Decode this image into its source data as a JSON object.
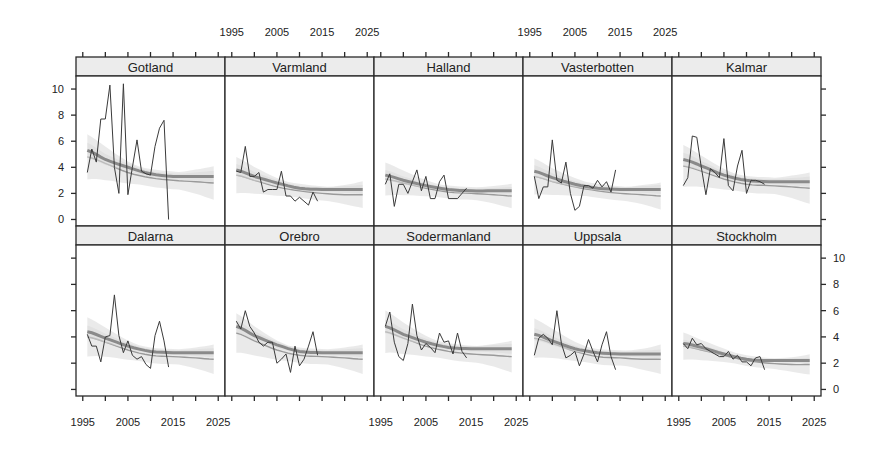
{
  "chart_data": {
    "type": "line",
    "layout": "lattice panels 5 columns x 2 rows",
    "title": "",
    "xlabel": "",
    "ylabel": "",
    "x_ticks": [
      1995,
      2005,
      2015,
      2025
    ],
    "y_ticks": [
      0,
      2,
      4,
      6,
      8,
      10
    ],
    "xlim": [
      1993.5,
      2026.5
    ],
    "ylim": [
      -0.5,
      11.0
    ],
    "grid": false,
    "legend": null,
    "series_description": {
      "observed": "thin dark line (observed annual values)",
      "trend_a": "thick grey smooth line with light grey band (model fit A)",
      "trend_b": "thin grey smooth line with light grey band (model fit B)"
    },
    "panels": [
      {
        "name": "Gotland",
        "row": 0,
        "col": 0,
        "observed_x": [
          1996,
          1997,
          1998,
          1999,
          2000,
          2001,
          2002,
          2003,
          2004,
          2005,
          2006,
          2007,
          2008,
          2009,
          2010,
          2011,
          2012,
          2013,
          2014
        ],
        "observed_y": [
          3.6,
          5.4,
          4.4,
          7.7,
          7.7,
          10.3,
          4.0,
          2.0,
          10.4,
          1.9,
          4.0,
          6.1,
          3.7,
          3.5,
          3.4,
          5.6,
          7.0,
          7.6,
          0.0
        ],
        "trend_a": {
          "x": [
            1996,
            2000,
            2005,
            2010,
            2015,
            2020,
            2024
          ],
          "y": [
            5.3,
            4.6,
            4.0,
            3.5,
            3.3,
            3.3,
            3.3
          ],
          "band": 0.5
        },
        "trend_b": {
          "x": [
            1996,
            2000,
            2005,
            2010,
            2015,
            2020,
            2024
          ],
          "y": [
            4.8,
            4.3,
            3.6,
            3.2,
            3.0,
            2.9,
            2.8
          ],
          "band": 1.5
        }
      },
      {
        "name": "Varmland",
        "row": 0,
        "col": 1,
        "observed_x": [
          1996,
          1997,
          1998,
          1999,
          2000,
          2001,
          2002,
          2003,
          2004,
          2005,
          2006,
          2007,
          2008,
          2009,
          2010,
          2011,
          2012,
          2013,
          2014
        ],
        "observed_y": [
          3.7,
          3.6,
          5.6,
          3.3,
          3.3,
          3.6,
          2.1,
          2.3,
          2.3,
          2.3,
          3.7,
          1.8,
          1.8,
          1.4,
          1.7,
          1.4,
          1.1,
          2.1,
          1.4
        ],
        "trend_a": {
          "x": [
            1996,
            2000,
            2005,
            2010,
            2015,
            2020,
            2024
          ],
          "y": [
            3.8,
            3.3,
            2.8,
            2.4,
            2.3,
            2.3,
            2.3
          ],
          "band": 0.4
        },
        "trend_b": {
          "x": [
            1996,
            2000,
            2005,
            2010,
            2015,
            2020,
            2024
          ],
          "y": [
            3.4,
            3.0,
            2.5,
            2.2,
            2.0,
            1.9,
            1.9
          ],
          "band": 1.2
        }
      },
      {
        "name": "Halland",
        "row": 0,
        "col": 2,
        "observed_x": [
          1996,
          1997,
          1998,
          1999,
          2000,
          2001,
          2002,
          2003,
          2004,
          2005,
          2006,
          2007,
          2008,
          2009,
          2010,
          2011,
          2012,
          2013,
          2014
        ],
        "observed_y": [
          2.7,
          3.5,
          1.0,
          2.7,
          2.7,
          2.0,
          2.9,
          3.8,
          2.2,
          3.3,
          1.6,
          1.6,
          2.9,
          3.4,
          1.6,
          1.6,
          1.6,
          2.0,
          2.4
        ],
        "trend_a": {
          "x": [
            1996,
            2000,
            2005,
            2010,
            2015,
            2020,
            2024
          ],
          "y": [
            3.4,
            3.0,
            2.6,
            2.3,
            2.2,
            2.2,
            2.2
          ],
          "band": 0.35
        },
        "trend_b": {
          "x": [
            1996,
            2000,
            2005,
            2010,
            2015,
            2020,
            2024
          ],
          "y": [
            3.1,
            2.8,
            2.4,
            2.1,
            2.0,
            1.9,
            1.8
          ],
          "band": 1.1
        }
      },
      {
        "name": "Vasterbotten",
        "row": 0,
        "col": 3,
        "observed_x": [
          1996,
          1997,
          1998,
          1999,
          2000,
          2001,
          2002,
          2003,
          2004,
          2005,
          2006,
          2007,
          2008,
          2009,
          2010,
          2011,
          2012,
          2013,
          2014
        ],
        "observed_y": [
          3.3,
          1.6,
          2.5,
          2.5,
          6.1,
          3.0,
          2.8,
          4.4,
          2.0,
          0.7,
          1.0,
          2.6,
          2.6,
          2.4,
          3.0,
          2.5,
          2.9,
          2.1,
          3.8
        ],
        "trend_a": {
          "x": [
            1996,
            2000,
            2005,
            2010,
            2015,
            2020,
            2024
          ],
          "y": [
            3.7,
            3.2,
            2.7,
            2.4,
            2.3,
            2.3,
            2.3
          ],
          "band": 0.4
        },
        "trend_b": {
          "x": [
            1996,
            2000,
            2005,
            2010,
            2015,
            2020,
            2024
          ],
          "y": [
            3.3,
            2.9,
            2.5,
            2.2,
            2.0,
            1.9,
            1.8
          ],
          "band": 1.2
        }
      },
      {
        "name": "Kalmar",
        "row": 0,
        "col": 4,
        "observed_x": [
          1996,
          1997,
          1998,
          1999,
          2000,
          2001,
          2002,
          2003,
          2004,
          2005,
          2006,
          2007,
          2008,
          2009,
          2010,
          2011,
          2012,
          2013,
          2014
        ],
        "observed_y": [
          2.6,
          3.2,
          6.4,
          6.3,
          4.0,
          1.9,
          3.9,
          3.6,
          3.2,
          6.2,
          2.6,
          2.2,
          4.1,
          5.3,
          2.0,
          3.0,
          3.0,
          2.9,
          2.7
        ],
        "trend_a": {
          "x": [
            1996,
            2000,
            2005,
            2010,
            2015,
            2020,
            2024
          ],
          "y": [
            4.6,
            4.1,
            3.4,
            3.0,
            2.9,
            2.9,
            2.9
          ],
          "band": 0.45
        },
        "trend_b": {
          "x": [
            1996,
            2000,
            2005,
            2010,
            2015,
            2020,
            2024
          ],
          "y": [
            4.1,
            3.7,
            3.1,
            2.7,
            2.6,
            2.5,
            2.4
          ],
          "band": 1.4
        }
      },
      {
        "name": "Dalarna",
        "row": 1,
        "col": 0,
        "observed_x": [
          1996,
          1997,
          1998,
          1999,
          2000,
          2001,
          2002,
          2003,
          2004,
          2005,
          2006,
          2007,
          2008,
          2009,
          2010,
          2011,
          2012,
          2013,
          2014
        ],
        "observed_y": [
          4.2,
          3.3,
          3.3,
          2.1,
          4.0,
          4.1,
          7.2,
          4.1,
          2.8,
          3.7,
          2.6,
          2.3,
          2.5,
          1.9,
          1.6,
          4.1,
          5.2,
          3.7,
          1.7
        ],
        "trend_a": {
          "x": [
            1996,
            2000,
            2005,
            2010,
            2015,
            2020,
            2024
          ],
          "y": [
            4.4,
            3.9,
            3.3,
            2.9,
            2.8,
            2.8,
            2.8
          ],
          "band": 0.4
        },
        "trend_b": {
          "x": [
            1996,
            2000,
            2005,
            2010,
            2015,
            2020,
            2024
          ],
          "y": [
            4.0,
            3.6,
            3.0,
            2.6,
            2.5,
            2.4,
            2.3
          ],
          "band": 1.3
        }
      },
      {
        "name": "Orebro",
        "row": 1,
        "col": 1,
        "observed_x": [
          1996,
          1997,
          1998,
          1999,
          2000,
          2001,
          2002,
          2003,
          2004,
          2005,
          2006,
          2007,
          2008,
          2009,
          2010,
          2011,
          2012,
          2013,
          2014
        ],
        "observed_y": [
          5.2,
          4.6,
          6.0,
          4.8,
          4.3,
          3.6,
          3.3,
          3.6,
          3.6,
          2.0,
          2.3,
          2.7,
          1.3,
          3.3,
          1.8,
          2.3,
          3.3,
          4.4,
          2.6
        ],
        "trend_a": {
          "x": [
            1996,
            2000,
            2005,
            2010,
            2015,
            2020,
            2024
          ],
          "y": [
            4.8,
            4.1,
            3.4,
            2.9,
            2.8,
            2.8,
            2.8
          ],
          "band": 0.4
        },
        "trend_b": {
          "x": [
            1996,
            2000,
            2005,
            2010,
            2015,
            2020,
            2024
          ],
          "y": [
            4.3,
            3.7,
            3.0,
            2.6,
            2.5,
            2.4,
            2.3
          ],
          "band": 1.3
        }
      },
      {
        "name": "Sodermanland",
        "row": 1,
        "col": 2,
        "observed_x": [
          1996,
          1997,
          1998,
          1999,
          2000,
          2001,
          2002,
          2003,
          2004,
          2005,
          2006,
          2007,
          2008,
          2009,
          2010,
          2011,
          2012,
          2013,
          2014
        ],
        "observed_y": [
          4.8,
          5.9,
          3.6,
          2.5,
          2.2,
          3.5,
          6.5,
          4.1,
          3.0,
          3.5,
          3.2,
          2.8,
          4.3,
          3.6,
          3.7,
          2.7,
          4.3,
          2.9,
          2.4
        ],
        "trend_a": {
          "x": [
            1996,
            2000,
            2005,
            2010,
            2015,
            2020,
            2024
          ],
          "y": [
            4.8,
            4.2,
            3.6,
            3.2,
            3.1,
            3.1,
            3.1
          ],
          "band": 0.45
        },
        "trend_b": {
          "x": [
            1996,
            2000,
            2005,
            2010,
            2015,
            2020,
            2024
          ],
          "y": [
            4.4,
            3.9,
            3.3,
            2.9,
            2.7,
            2.6,
            2.5
          ],
          "band": 1.4
        }
      },
      {
        "name": "Uppsala",
        "row": 1,
        "col": 3,
        "observed_x": [
          1996,
          1997,
          1998,
          1999,
          2000,
          2001,
          2002,
          2003,
          2004,
          2005,
          2006,
          2007,
          2008,
          2009,
          2010,
          2011,
          2012,
          2013,
          2014
        ],
        "observed_y": [
          2.6,
          3.9,
          4.2,
          3.9,
          3.4,
          6.0,
          3.5,
          2.4,
          2.6,
          2.9,
          1.8,
          2.7,
          3.8,
          2.9,
          2.1,
          3.4,
          4.4,
          2.5,
          1.5
        ],
        "trend_a": {
          "x": [
            1996,
            2000,
            2005,
            2010,
            2015,
            2020,
            2024
          ],
          "y": [
            4.2,
            3.7,
            3.1,
            2.8,
            2.7,
            2.7,
            2.7
          ],
          "band": 0.4
        },
        "trend_b": {
          "x": [
            1996,
            2000,
            2005,
            2010,
            2015,
            2020,
            2024
          ],
          "y": [
            3.9,
            3.5,
            2.9,
            2.5,
            2.4,
            2.3,
            2.3
          ],
          "band": 1.3
        }
      },
      {
        "name": "Stockholm",
        "row": 1,
        "col": 4,
        "observed_x": [
          1996,
          1997,
          1998,
          1999,
          2000,
          2001,
          2002,
          2003,
          2004,
          2005,
          2006,
          2007,
          2008,
          2009,
          2010,
          2011,
          2012,
          2013,
          2014
        ],
        "observed_y": [
          3.5,
          3.1,
          3.9,
          3.4,
          3.5,
          3.1,
          2.9,
          2.7,
          2.5,
          2.5,
          2.9,
          2.3,
          2.6,
          2.1,
          2.1,
          1.8,
          2.4,
          2.5,
          1.5
        ],
        "trend_a": {
          "x": [
            1996,
            2000,
            2005,
            2010,
            2015,
            2020,
            2024
          ],
          "y": [
            3.5,
            3.2,
            2.7,
            2.3,
            2.2,
            2.2,
            2.2
          ],
          "band": 0.25
        },
        "trend_b": {
          "x": [
            1996,
            2000,
            2005,
            2010,
            2015,
            2020,
            2024
          ],
          "y": [
            3.3,
            3.0,
            2.6,
            2.2,
            2.0,
            1.9,
            1.9
          ],
          "band": 0.9
        }
      }
    ],
    "axis_placement": {
      "left_y_ticks_labeled_row": 0,
      "right_y_ticks_labeled_row": 1,
      "top_x_labels_cols": [
        1,
        3
      ],
      "bottom_x_labels_cols": [
        0,
        2,
        4
      ]
    }
  },
  "style": {
    "observed_color": "#3a3a3a",
    "trend_a_color": "#8a8a8a",
    "trend_b_color": "#9a9a9a",
    "band_color": "#d9d9d9",
    "strip_color": "#ececec",
    "frame_color": "#2a2a2a"
  }
}
